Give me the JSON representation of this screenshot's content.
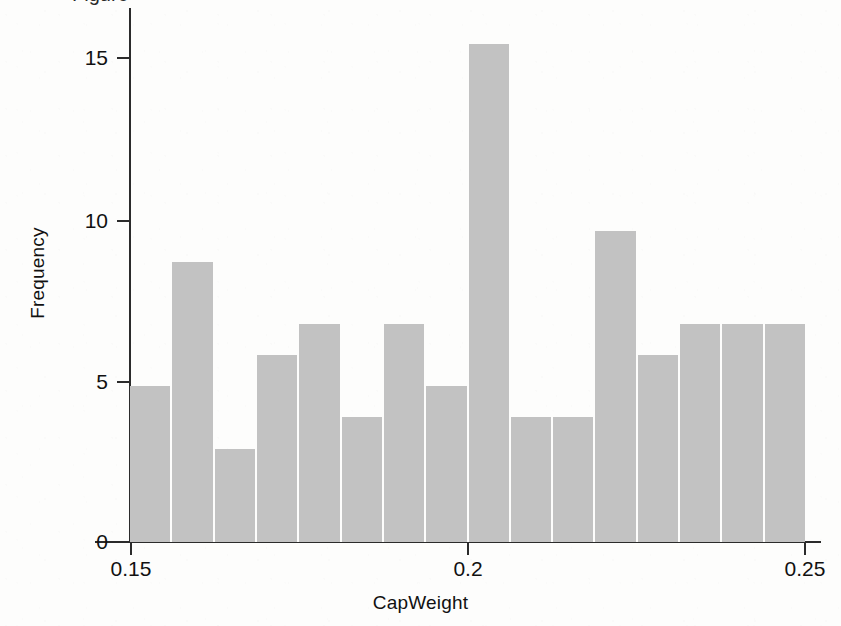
{
  "figure": {
    "cropped_caption_fragment": "Figure",
    "background_color": "#fdfdfc",
    "bar_color": "#c2c2c2",
    "axis_color": "#2b2b2b"
  },
  "chart_data": {
    "type": "bar",
    "chart_subtype": "histogram",
    "title": "",
    "xlabel": "CapWeight",
    "ylabel": "Frequency",
    "xlim": [
      0.15,
      0.25
    ],
    "ylim": [
      0,
      16.6
    ],
    "grid": false,
    "legend": null,
    "bin_width": 0.00625,
    "bin_count": 16,
    "x_tick_labels": [
      "0.15",
      "0.2",
      "0.25"
    ],
    "x_tick_values": [
      0.15,
      0.2,
      0.25
    ],
    "y_tick_labels": [
      "0",
      "5",
      "10",
      "15"
    ],
    "y_tick_values": [
      0,
      5,
      10,
      15
    ],
    "bin_edges": [
      0.15,
      0.15625,
      0.1625,
      0.16875,
      0.175,
      0.18125,
      0.1875,
      0.19375,
      0.2,
      0.20625,
      0.2125,
      0.21875,
      0.225,
      0.23125,
      0.2375,
      0.24375,
      0.25
    ],
    "categories": [
      "0.150-0.156",
      "0.156-0.163",
      "0.163-0.169",
      "0.169-0.175",
      "0.175-0.181",
      "0.181-0.188",
      "0.188-0.194",
      "0.194-0.200",
      "0.200-0.206",
      "0.206-0.213",
      "0.213-0.219",
      "0.219-0.225",
      "0.225-0.231",
      "0.231-0.238",
      "0.238-0.244",
      "0.244-0.250"
    ],
    "values": [
      5,
      9,
      3,
      6,
      7,
      4,
      7,
      5,
      16,
      4,
      4,
      10,
      6,
      7,
      7,
      7
    ],
    "total_count": 107
  }
}
